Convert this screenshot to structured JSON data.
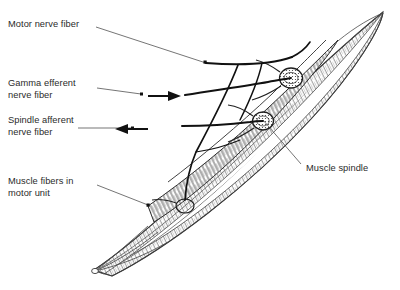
{
  "figure": {
    "kind": "anatomical-line-diagram",
    "background_color": "#ffffff",
    "ink_color": "#2b2b2b",
    "line_color": "#1a1a1a",
    "shading_color": "#9a9a9a"
  },
  "labels": [
    {
      "id": "motor-nerve-fiber",
      "text": "Motor nerve fiber",
      "lines": [
        "Motor nerve fiber"
      ],
      "x": 8,
      "y": 19,
      "leader": "thin line running right and down to a dot on the nerve trunk"
    },
    {
      "id": "gamma-efferent-nerve-fiber",
      "text": "Gamma efferent nerve fiber",
      "lines": [
        "Gamma efferent",
        "nerve fiber"
      ],
      "x": 8,
      "y": 78,
      "leader": "thin line to a dot, then arrowhead pointing right toward muscle"
    },
    {
      "id": "spindle-afferent-nerve-fiber",
      "text": "Spindle afferent nerve fiber",
      "lines": [
        "Spindle afferent",
        "nerve fiber"
      ],
      "x": 8,
      "y": 115,
      "leader": "thin line to a dot, then arrowhead pointing left away from muscle"
    },
    {
      "id": "muscle-fibers-in-motor-unit",
      "text": "Muscle fibers in motor unit",
      "lines": [
        "Muscle fibers in",
        "motor unit"
      ],
      "x": 8,
      "y": 176,
      "leader": "thin line running right and down to a dot on a muscle fiber"
    },
    {
      "id": "muscle-spindle",
      "text": "Muscle spindle",
      "lines": [
        "Muscle spindle"
      ],
      "x": 306,
      "y": 163,
      "leader": "thin line running up and left to the encapsulated spindle"
    }
  ],
  "structures": [
    {
      "id": "muscle-belly",
      "name": "fusiform skeletal muscle belly"
    },
    {
      "id": "muscle-fiber-bundle",
      "name": "striated muscle fiber bundles"
    },
    {
      "id": "muscle-spindle-capsule-upper",
      "name": "upper muscle spindle capsule"
    },
    {
      "id": "muscle-spindle-capsule-lower",
      "name": "lower muscle spindle capsule"
    },
    {
      "id": "motor-end-plate",
      "name": "motor end plate"
    },
    {
      "id": "nerve-trunk",
      "name": "nerve trunk entering muscle"
    }
  ],
  "arrows": [
    {
      "id": "gamma-efferent-arrow",
      "direction": "right",
      "meaning": "efferent toward muscle"
    },
    {
      "id": "spindle-afferent-arrow",
      "direction": "left",
      "meaning": "afferent away from muscle"
    }
  ]
}
